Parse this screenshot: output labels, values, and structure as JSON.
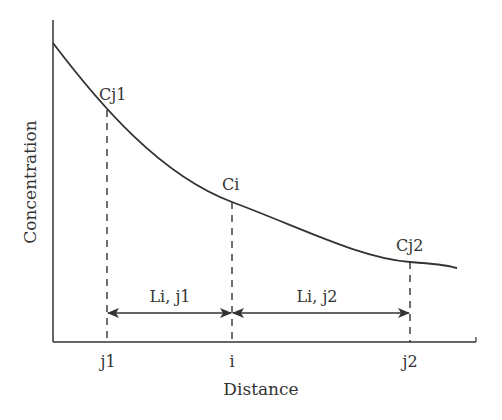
{
  "diagram": {
    "axes": {
      "xlabel": "Distance",
      "ylabel": "Concentration"
    },
    "x_ticks": [
      {
        "label": "j1",
        "x": 107
      },
      {
        "label": "i",
        "x": 232
      },
      {
        "label": "j2",
        "x": 410
      }
    ],
    "points": [
      {
        "label": "Cj1",
        "x": 107,
        "y": 110
      },
      {
        "label": "Ci",
        "x": 232,
        "y": 202
      },
      {
        "label": "Cj2",
        "x": 410,
        "y": 262
      }
    ],
    "distances": [
      {
        "label": "Li, j1",
        "from": "j1",
        "to": "i"
      },
      {
        "label": "Li, j2",
        "from": "i",
        "to": "j2"
      }
    ],
    "curve": {
      "description": "Decaying concentration curve",
      "start": [
        53,
        43
      ],
      "end": [
        457,
        268
      ]
    },
    "colors": {
      "line": "#333333",
      "background": "#ffffff"
    }
  }
}
